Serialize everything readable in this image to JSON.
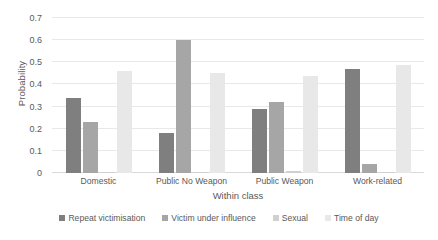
{
  "chart_data": {
    "type": "bar",
    "title": "",
    "xlabel": "Within class",
    "ylabel": "Probability",
    "categories": [
      "Domestic",
      "Public No Weapon",
      "Public Weapon",
      "Work-related"
    ],
    "series": [
      {
        "name": "Repeat victimisation",
        "color": "#7f7f7f",
        "values": [
          0.34,
          0.18,
          0.29,
          0.47
        ]
      },
      {
        "name": "Victim under influence",
        "color": "#a6a6a6",
        "values": [
          0.23,
          0.6,
          0.32,
          0.04
        ]
      },
      {
        "name": "Sexual",
        "color": "#d0d0d0",
        "values": [
          0.005,
          0.004,
          0.01,
          0.003
        ]
      },
      {
        "name": "Time of day",
        "color": "#e8e8e8",
        "values": [
          0.46,
          0.45,
          0.44,
          0.49
        ]
      }
    ],
    "ylim": [
      0,
      0.7
    ],
    "yticks": [
      "0",
      "0.1",
      "0.2",
      "0.3",
      "0.4",
      "0.5",
      "0.6",
      "0.7"
    ],
    "ytick_values": [
      0,
      0.1,
      0.2,
      0.3,
      0.4,
      0.5,
      0.6,
      0.7
    ],
    "grid": true,
    "legend_position": "bottom"
  }
}
